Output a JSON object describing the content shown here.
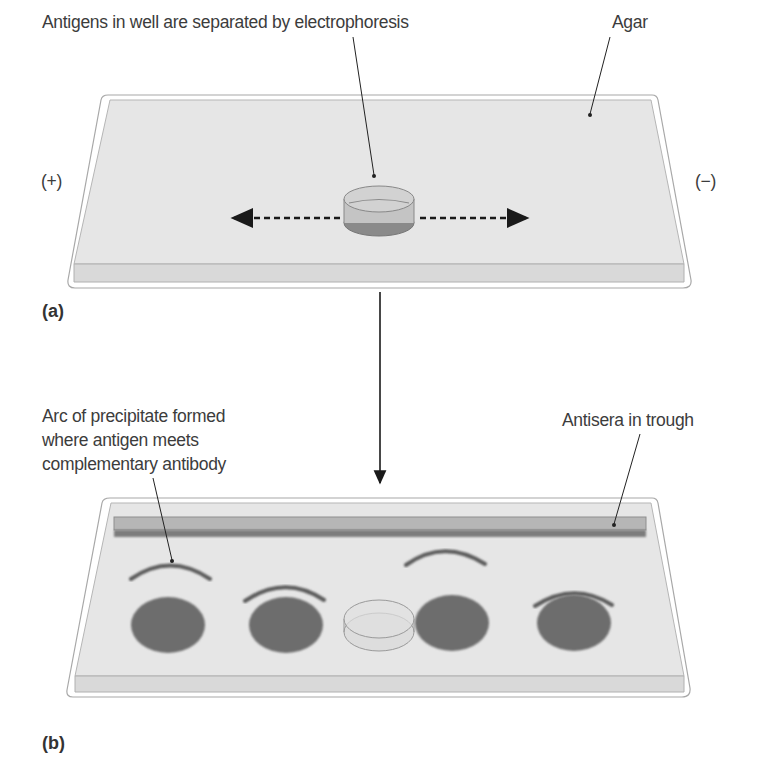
{
  "diagram": {
    "panel_a": {
      "label": "(a)",
      "callout_wells": "Antigens in well are separated by electrophoresis",
      "callout_agar": "Agar",
      "anode": "(+)",
      "cathode": "(−)"
    },
    "panel_b": {
      "label": "(b)",
      "callout_arc": [
        "Arc of precipitate formed",
        "where antigen meets",
        "complementary antibody"
      ],
      "callout_trough": "Antisera in trough"
    },
    "colors": {
      "agar": "#e4e4e4",
      "agar_edge": "#bdbdbd",
      "tray_outline": "#9a9a9a",
      "well_fill": "#b9b9b9",
      "antigen_spot": "#6f6f6f",
      "arc": "#5f5f5f",
      "trough": "#a8a8a8",
      "arrow": "#1a1a1a"
    }
  }
}
